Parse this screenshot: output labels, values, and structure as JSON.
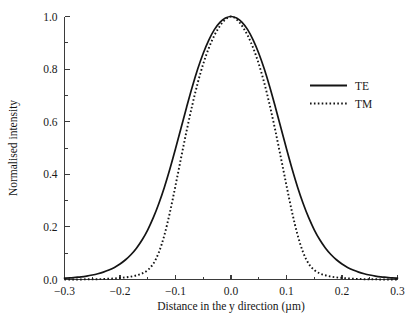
{
  "chart_data": {
    "type": "line",
    "title": "",
    "xlabel": "Distance in the y direction (µm)",
    "ylabel": "Normalised intensity",
    "xlim": [
      -0.3,
      0.3
    ],
    "ylim": [
      0.0,
      1.0
    ],
    "grid": false,
    "legend_position": "right-upper-inside",
    "x_ticks": [
      "−0.3",
      "−0.2",
      "−0.1",
      "0.0",
      "0.1",
      "0.2",
      "0.3"
    ],
    "x_tick_values": [
      -0.3,
      -0.2,
      -0.1,
      0.0,
      0.1,
      0.2,
      0.3
    ],
    "x_minor_tick_values": [
      -0.25,
      -0.15,
      -0.05,
      0.05,
      0.15,
      0.25
    ],
    "y_ticks": [
      "0.0",
      "0.2",
      "0.4",
      "0.6",
      "0.8",
      "1.0"
    ],
    "y_tick_values": [
      0.0,
      0.2,
      0.4,
      0.6,
      0.8,
      1.0
    ],
    "y_minor_tick_values": [
      0.1,
      0.3,
      0.5,
      0.7,
      0.9
    ],
    "x": [
      -0.3,
      -0.29,
      -0.28,
      -0.27,
      -0.26,
      -0.25,
      -0.24,
      -0.23,
      -0.22,
      -0.21,
      -0.2,
      -0.19,
      -0.18,
      -0.17,
      -0.16,
      -0.15,
      -0.14,
      -0.13,
      -0.12,
      -0.11,
      -0.1,
      -0.09,
      -0.08,
      -0.07,
      -0.06,
      -0.05,
      -0.04,
      -0.03,
      -0.02,
      -0.01,
      0.0,
      0.01,
      0.02,
      0.03,
      0.04,
      0.05,
      0.06,
      0.07,
      0.08,
      0.09,
      0.1,
      0.11,
      0.12,
      0.13,
      0.14,
      0.15,
      0.16,
      0.17,
      0.18,
      0.19,
      0.2,
      0.21,
      0.22,
      0.23,
      0.24,
      0.25,
      0.26,
      0.27,
      0.28,
      0.29,
      0.3
    ],
    "series": [
      {
        "name": "TE",
        "style": "solid",
        "color": "#141414",
        "values": [
          0.005,
          0.006,
          0.008,
          0.01,
          0.013,
          0.017,
          0.022,
          0.028,
          0.036,
          0.046,
          0.059,
          0.075,
          0.095,
          0.12,
          0.151,
          0.189,
          0.235,
          0.289,
          0.351,
          0.421,
          0.497,
          0.576,
          0.655,
          0.731,
          0.8,
          0.86,
          0.91,
          0.95,
          0.978,
          0.994,
          1.0,
          0.994,
          0.978,
          0.95,
          0.91,
          0.86,
          0.8,
          0.731,
          0.655,
          0.576,
          0.497,
          0.421,
          0.351,
          0.289,
          0.235,
          0.189,
          0.151,
          0.12,
          0.095,
          0.075,
          0.059,
          0.046,
          0.036,
          0.028,
          0.022,
          0.017,
          0.013,
          0.01,
          0.008,
          0.006,
          0.005
        ]
      },
      {
        "name": "TM",
        "style": "dotted",
        "color": "#141414",
        "values": [
          0.0,
          0.0,
          0.0,
          0.0,
          0.001,
          0.001,
          0.001,
          0.002,
          0.003,
          0.004,
          0.006,
          0.008,
          0.011,
          0.016,
          0.023,
          0.036,
          0.06,
          0.103,
          0.169,
          0.256,
          0.357,
          0.462,
          0.565,
          0.661,
          0.747,
          0.82,
          0.88,
          0.928,
          0.964,
          0.989,
          1.0,
          0.989,
          0.964,
          0.928,
          0.88,
          0.82,
          0.747,
          0.661,
          0.565,
          0.462,
          0.357,
          0.256,
          0.169,
          0.103,
          0.06,
          0.036,
          0.023,
          0.016,
          0.011,
          0.008,
          0.006,
          0.004,
          0.003,
          0.002,
          0.001,
          0.001,
          0.001,
          0.0,
          0.0,
          0.0,
          0.0
        ]
      }
    ]
  },
  "legend": {
    "entries": [
      {
        "label": "TE",
        "style": "solid"
      },
      {
        "label": "TM",
        "style": "dotted"
      }
    ]
  }
}
